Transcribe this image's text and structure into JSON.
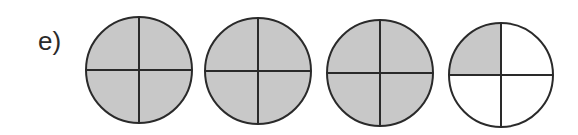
{
  "problem": {
    "label": "e)",
    "description": "Four circles each divided into 4 equal parts; shaded quarters represent a fraction",
    "circles": [
      {
        "cx": 139,
        "cy": 70,
        "r": 53,
        "parts": 4,
        "shaded": [
          true,
          true,
          true,
          true
        ]
      },
      {
        "cx": 258,
        "cy": 71,
        "r": 53,
        "parts": 4,
        "shaded": [
          true,
          true,
          true,
          true
        ]
      },
      {
        "cx": 380,
        "cy": 73,
        "r": 53,
        "parts": 4,
        "shaded": [
          true,
          true,
          true,
          true
        ]
      },
      {
        "cx": 501,
        "cy": 75,
        "r": 52,
        "parts": 4,
        "shaded": [
          true,
          false,
          false,
          false
        ]
      }
    ],
    "shaded_quarters_total": 13,
    "colors": {
      "shade": "#c8c8c8",
      "stroke": "#2a2a2a",
      "background": "#ffffff"
    }
  }
}
